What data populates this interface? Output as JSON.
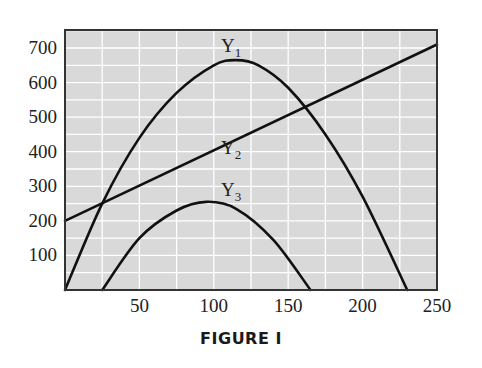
{
  "caption": "FIGURE I",
  "colors": {
    "plot_bg": "#d9d9d9",
    "grid": "#ffffff",
    "line": "#111111",
    "frame": "#333333"
  },
  "chart_data": {
    "type": "line",
    "title": "",
    "xlabel": "",
    "ylabel": "",
    "xlim": [
      0,
      250
    ],
    "ylim": [
      0,
      750
    ],
    "grid": true,
    "x_ticks": [
      50,
      100,
      150,
      200,
      250
    ],
    "y_ticks": [
      100,
      200,
      300,
      400,
      500,
      600,
      700
    ],
    "series": [
      {
        "name": "Y1",
        "label_main": "Y",
        "label_sub": "1",
        "x": [
          0,
          25,
          50,
          75,
          100,
          115,
          130,
          150,
          175,
          200,
          230
        ],
        "y": [
          0,
          250,
          440,
          570,
          650,
          665,
          650,
          585,
          450,
          270,
          0
        ]
      },
      {
        "name": "Y2",
        "label_main": "Y",
        "label_sub": "2",
        "x": [
          0,
          250
        ],
        "y": [
          200,
          710
        ]
      },
      {
        "name": "Y3",
        "label_main": "Y",
        "label_sub": "3",
        "x": [
          25,
          50,
          75,
          95,
          115,
          140,
          165
        ],
        "y": [
          0,
          150,
          230,
          255,
          235,
          145,
          0
        ]
      }
    ],
    "annotations": [
      {
        "text": "Y1",
        "x": 108,
        "y": 700
      },
      {
        "text": "Y2",
        "x": 108,
        "y": 440
      },
      {
        "text": "Y3",
        "x": 108,
        "y": 280
      }
    ]
  }
}
